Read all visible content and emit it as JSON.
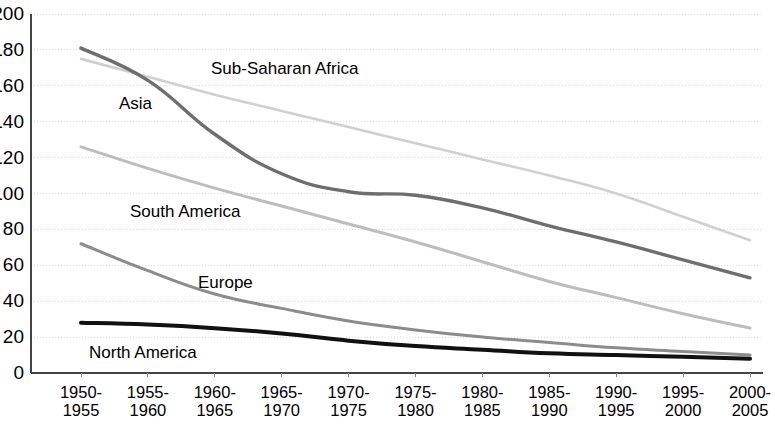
{
  "chart_data": {
    "type": "line",
    "title": "",
    "xlabel": "",
    "ylabel": "",
    "ylim": [
      0,
      200
    ],
    "ytick_step": 20,
    "grid": true,
    "legend_position": "inline-labels",
    "categories": [
      "1950-\n1955",
      "1955-\n1960",
      "1960-\n1965",
      "1965-\n1970",
      "1970-\n1975",
      "1975-\n1980",
      "1980-\n1985",
      "1985-\n1990",
      "1990-\n1995",
      "1995-\n2000",
      "2000-\n2005"
    ],
    "categories_line1": [
      "1950-",
      "1955-",
      "1960-",
      "1965-",
      "1970-",
      "1975-",
      "1980-",
      "1985-",
      "1990-",
      "1995-",
      "2000-"
    ],
    "categories_line2": [
      "1955",
      "1960",
      "1965",
      "1970",
      "1975",
      "1980",
      "1985",
      "1990",
      "1995",
      "2000",
      "2005"
    ],
    "ytick_labels": [
      "200",
      "180",
      "160",
      "140",
      "120",
      "100",
      "80",
      "60",
      "40",
      "20",
      "0"
    ],
    "ytick_values": [
      200,
      180,
      160,
      140,
      120,
      100,
      80,
      60,
      40,
      20,
      0
    ],
    "series": [
      {
        "name": "Sub-Saharan Africa",
        "color": "#d0d0d0",
        "width": 2.6,
        "values": [
          175,
          165,
          155,
          146,
          137,
          128,
          119,
          110,
          100,
          87,
          74
        ],
        "label_x": 211,
        "label_y": 60
      },
      {
        "name": "Asia",
        "color": "#6e6e6e",
        "width": 3.4,
        "values": [
          181,
          163,
          133,
          111,
          101,
          99,
          92,
          82,
          73,
          63,
          53
        ],
        "label_x": 119,
        "label_y": 95
      },
      {
        "name": "South America",
        "color": "#bdbdbd",
        "width": 3.0,
        "values": [
          126,
          114,
          103,
          93,
          83,
          73,
          62,
          51,
          42,
          33,
          25
        ],
        "label_x": 130,
        "label_y": 203
      },
      {
        "name": "Europe",
        "color": "#8c8c8c",
        "width": 3.0,
        "values": [
          72,
          57,
          44,
          36,
          29,
          24,
          20,
          17,
          14,
          12,
          10
        ],
        "label_x": 198,
        "label_y": 274
      },
      {
        "name": "North America",
        "color": "#111111",
        "width": 4.0,
        "values": [
          28,
          27,
          25,
          22,
          18,
          15,
          13,
          11,
          10,
          9,
          8
        ],
        "label_x": 89,
        "label_y": 344
      }
    ]
  },
  "axes": {
    "plot_left": 31,
    "plot_right": 763,
    "plot_top": 14,
    "plot_bottom": 373,
    "first_point_x": 81,
    "last_point_x": 750,
    "grid_color": "#dcdcdc",
    "axis_color": "#444444"
  }
}
